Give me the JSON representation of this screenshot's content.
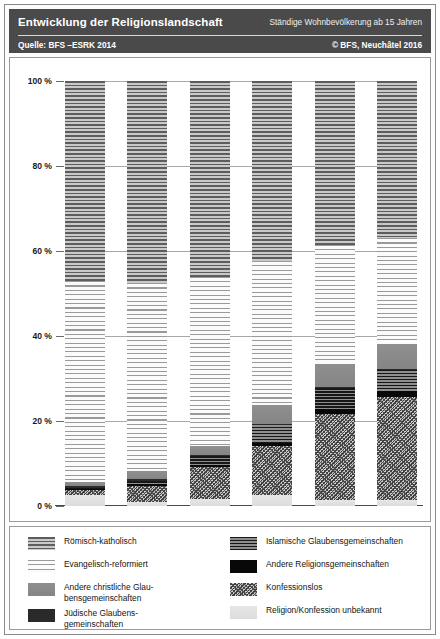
{
  "header": {
    "title": "Entwicklung der Religionslandschaft",
    "subtitle": "Ständige Wohnbevölkerung ab 15 Jahren",
    "source": "Quelle: BFS –ESRK 2014",
    "copyright": "© BFS, Neuchâtel 2016"
  },
  "legend": {
    "left": [
      {
        "key": "catholic",
        "label": "Römisch-katholisch"
      },
      {
        "key": "protestant",
        "label": "Evangelisch-reformiert"
      },
      {
        "key": "otherchrist",
        "label": "Andere christliche Glau-\nbensgemeinschaften"
      },
      {
        "key": "jewish",
        "label": "Jüdische Glaubens-\ngemeinschaften"
      }
    ],
    "right": [
      {
        "key": "islamic",
        "label": "Islamische Glaubensgemeinschaften"
      },
      {
        "key": "otherrel",
        "label": "Andere Religionsgemeinschaften"
      },
      {
        "key": "none",
        "label": "Konfessionslos"
      },
      {
        "key": "unknown",
        "label": "Religion/Konfession unbekannt"
      }
    ]
  },
  "chart_data": {
    "type": "bar",
    "stacked": true,
    "normalized": true,
    "title": "Entwicklung der Religionslandschaft",
    "subtitle": "Ständige Wohnbevölkerung ab 15 Jahren",
    "xlabel": "",
    "ylabel": "",
    "ylim": [
      0,
      100
    ],
    "yticks": [
      0,
      20,
      40,
      60,
      80,
      100
    ],
    "ytick_labels": [
      "0 %",
      "20 %",
      "40 %",
      "60 %",
      "80 %",
      "100 %"
    ],
    "grid": true,
    "legend_position": "bottom",
    "categories": [
      "1970",
      "1980",
      "1990",
      "2000",
      "2010",
      "2015"
    ],
    "stack_order_bottom_to_top": [
      "unknown",
      "none",
      "otherrel",
      "islamic",
      "jewish",
      "otherchrist",
      "protestant",
      "catholic"
    ],
    "series": [
      {
        "name": "Römisch-katholisch",
        "key": "catholic",
        "color": "#7d7d7d",
        "values": [
          47.0,
          47.6,
          46.2,
          42.3,
          38.6,
          37.0
        ]
      },
      {
        "name": "Evangelisch-reformiert",
        "key": "protestant",
        "color": "#f2f2f2",
        "values": [
          47.3,
          44.2,
          39.6,
          33.9,
          28.0,
          24.9
        ]
      },
      {
        "name": "Andere christliche Glaubensgemeinschaften",
        "key": "otherchrist",
        "color": "#8c8c8c",
        "values": [
          1.0,
          1.9,
          2.1,
          4.4,
          5.5,
          5.8
        ]
      },
      {
        "name": "Jüdische Glaubensgemeinschaften",
        "key": "jewish",
        "color": "#2a2a2a",
        "values": [
          0.4,
          0.3,
          0.3,
          0.2,
          0.2,
          0.2
        ]
      },
      {
        "name": "Islamische Glaubensgemeinschaften",
        "key": "islamic",
        "color": "#3a3a3a",
        "values": [
          0.3,
          0.9,
          2.2,
          4.3,
          4.9,
          5.1
        ]
      },
      {
        "name": "Andere Religionsgemeinschaften",
        "key": "otherrel",
        "color": "#080808",
        "values": [
          0.1,
          0.3,
          0.5,
          0.8,
          1.2,
          1.3
        ]
      },
      {
        "name": "Konfessionslos",
        "key": "none",
        "color": "#9e9e9e",
        "values": [
          1.2,
          3.9,
          7.5,
          11.4,
          20.1,
          24.2
        ]
      },
      {
        "name": "Religion/Konfession unbekannt",
        "key": "unknown",
        "color": "#e2e2e2",
        "values": [
          2.7,
          0.9,
          1.6,
          2.7,
          1.5,
          1.5
        ]
      }
    ]
  }
}
